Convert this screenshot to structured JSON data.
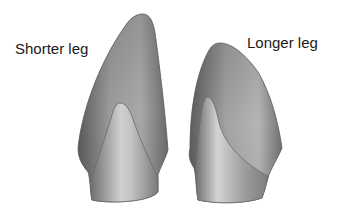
{
  "figure": {
    "labels": {
      "left": "Shorter leg",
      "right": "Longer leg"
    },
    "models": [
      {
        "name": "shorter-leg-model",
        "label_ref": "left"
      },
      {
        "name": "longer-leg-model",
        "label_ref": "right"
      }
    ],
    "colors": {
      "background": "#ffffff",
      "shape_dark": "#5e5e5e",
      "shape_mid": "#8f8f8f",
      "shape_light": "#c9c9c9",
      "text": "#1a1a1a"
    }
  }
}
